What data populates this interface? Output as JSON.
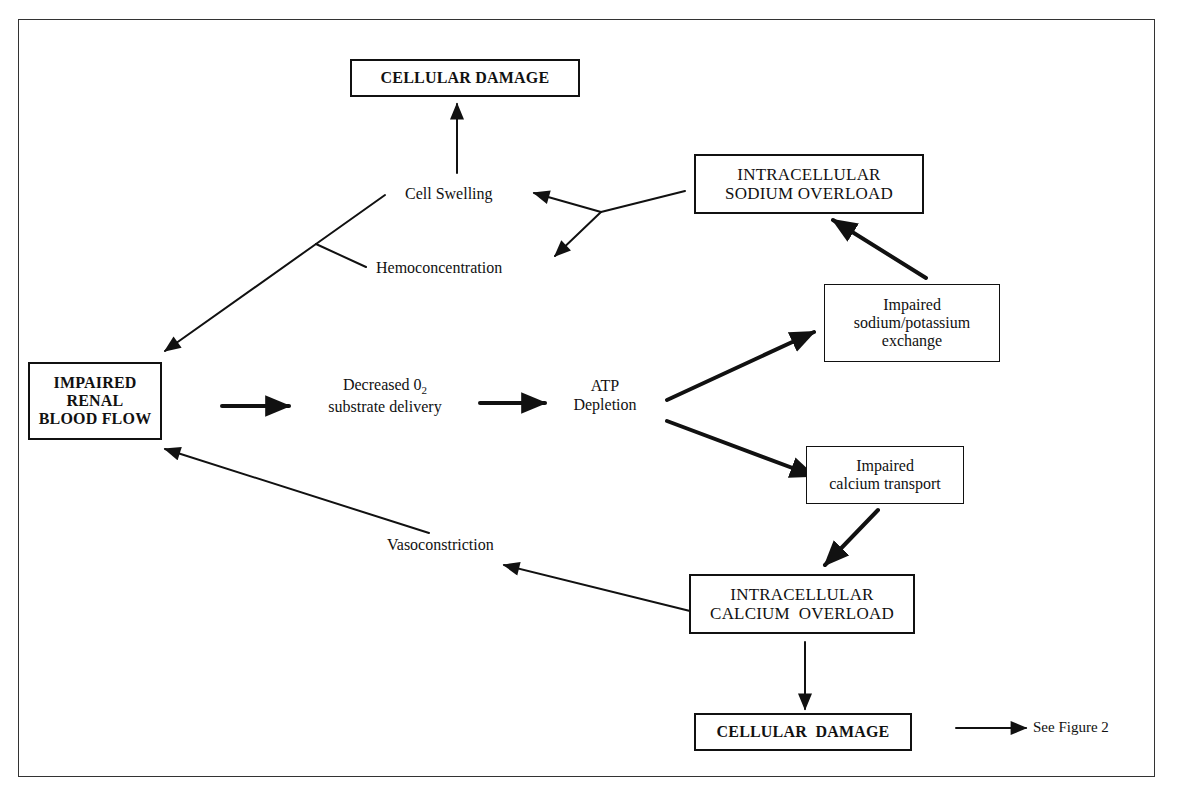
{
  "diagram": {
    "nodes": {
      "cellular_damage_top": {
        "lines": [
          "CELLULAR DAMAGE"
        ]
      },
      "sodium_overload": {
        "lines": [
          "INTRACELLULAR",
          "SODIUM OVERLOAD"
        ]
      },
      "cell_swelling": {
        "lines": [
          "Cell Swelling"
        ]
      },
      "hemoconcentration": {
        "lines": [
          "Hemoconcentration"
        ]
      },
      "impaired_renal": {
        "lines": [
          "IMPAIRED",
          "RENAL",
          "BLOOD FLOW"
        ]
      },
      "decreased_o2": {
        "line1": "Decreased 0",
        "line1_sub": "2",
        "line2": "substrate delivery"
      },
      "atp_depletion": {
        "lines": [
          "ATP",
          "Depletion"
        ]
      },
      "na_k_exchange": {
        "lines": [
          "Impaired",
          "sodium/potassium",
          "exchange"
        ]
      },
      "calcium_transport": {
        "lines": [
          "Impaired",
          "calcium transport"
        ]
      },
      "vasoconstriction": {
        "lines": [
          "Vasoconstriction"
        ]
      },
      "calcium_overload": {
        "lines": [
          "INTRACELLULAR",
          "CALCIUM  OVERLOAD"
        ]
      },
      "cellular_damage_bottom": {
        "lines": [
          "CELLULAR  DAMAGE"
        ]
      },
      "see_figure": {
        "lines": [
          "See Figure 2"
        ]
      }
    },
    "edges": [
      {
        "from": "cell_swelling",
        "to": "cellular_damage_top"
      },
      {
        "from": "sodium_overload",
        "to": "cell_swelling"
      },
      {
        "from": "sodium_overload",
        "to": "hemoconcentration"
      },
      {
        "from": "cell_swelling",
        "to": "impaired_renal"
      },
      {
        "from": "hemoconcentration",
        "to": "impaired_renal"
      },
      {
        "from": "impaired_renal",
        "to": "decreased_o2"
      },
      {
        "from": "decreased_o2",
        "to": "atp_depletion"
      },
      {
        "from": "atp_depletion",
        "to": "na_k_exchange"
      },
      {
        "from": "atp_depletion",
        "to": "calcium_transport"
      },
      {
        "from": "na_k_exchange",
        "to": "sodium_overload"
      },
      {
        "from": "calcium_transport",
        "to": "calcium_overload"
      },
      {
        "from": "calcium_overload",
        "to": "vasoconstriction"
      },
      {
        "from": "vasoconstriction",
        "to": "impaired_renal"
      },
      {
        "from": "calcium_overload",
        "to": "cellular_damage_bottom"
      },
      {
        "from": "cellular_damage_bottom",
        "to": "see_figure"
      }
    ],
    "colors": {
      "ink": "#111111",
      "background": "#ffffff"
    }
  }
}
